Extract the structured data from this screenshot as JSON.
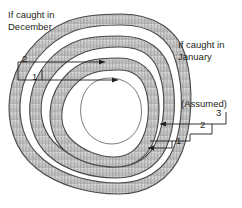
{
  "figure": {
    "background": "#ffffff",
    "ink": "#3a3a3a",
    "band_fill": "#d9d9d9",
    "band_stroke": "#555555",
    "leader_color": "#231f20"
  },
  "captions": {
    "december": "If caught in\nDecember",
    "january": "If caught in\nJanuary",
    "assumed": "(Assumed)"
  },
  "left_labels": {
    "outer": "2",
    "inner": "1"
  },
  "right_labels": {
    "outer": "3",
    "middle": "2",
    "inner": "1"
  },
  "annuli": [
    {
      "name": "ring-1-innermost",
      "label_left": "1",
      "label_right": "1"
    },
    {
      "name": "ring-2-middle",
      "label_left": "2",
      "label_right": "2"
    },
    {
      "name": "ring-3-outermost",
      "label_left": "",
      "label_right": "3"
    }
  ]
}
